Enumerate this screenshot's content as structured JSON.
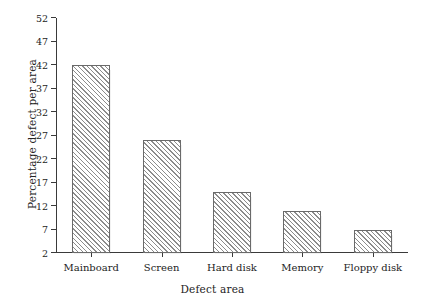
{
  "chart_data": {
    "type": "bar",
    "title": "",
    "categories": [
      "Mainboard",
      "Screen",
      "Hard disk",
      "Memory",
      "Floppy disk"
    ],
    "values": [
      42,
      26,
      15,
      11,
      7
    ],
    "xlabel": "Defect area",
    "ylabel": "Percentage defect per area",
    "ylim": [
      2,
      52
    ],
    "yticks": [
      2,
      7,
      12,
      17,
      22,
      27,
      32,
      37,
      42,
      47,
      52
    ],
    "ytick_labels": [
      "2",
      "7",
      "12",
      "17",
      "22",
      "27",
      "32",
      "37",
      "42",
      "47",
      "52"
    ],
    "grid": false,
    "legend": false,
    "bar_fill": "hatch-diagonal",
    "bar_edge_color": "#6a6a6a",
    "axis_color": "#3a3a3a",
    "background": "#ffffff"
  }
}
